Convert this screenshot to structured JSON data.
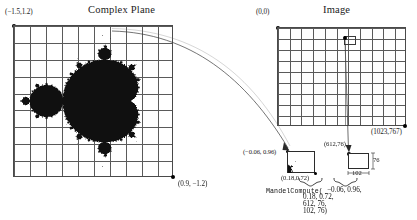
{
  "figure": {
    "panels": {
      "complex_plane": {
        "title": "Complex Plane",
        "corner_top_left": "(−1.5,1.2)",
        "corner_bottom_right": "(0.9, −1.2)",
        "grid_cols": 10,
        "grid_rows": 9,
        "content": "mandelbrot-set"
      },
      "image": {
        "title": "Image",
        "corner_top_left": "(0,0)",
        "corner_bottom_right": "(1023,767)",
        "grid_cols": 11,
        "grid_rows": 9
      }
    },
    "callouts": {
      "complex_region": {
        "top_left_label": "(−0.06, 0.96)",
        "bottom_right_label": "(0.18,0.72)"
      },
      "image_region": {
        "origin_label": "(612,76)",
        "height_label": "76",
        "width_label": "102"
      }
    },
    "call": {
      "function_name": "MandelCompute(",
      "line1_args": "−0.06, 0.96,",
      "line2_args": "0.18, 0.72,",
      "line3_args": "612, 76,",
      "line4_args": "102, 76)"
    }
  },
  "chart_data": {
    "type": "diagram",
    "panels": [
      {
        "name": "Complex Plane",
        "xlabel": "Re",
        "ylabel": "Im",
        "xlim": [
          -1.5,
          0.9
        ],
        "ylim": [
          -1.2,
          1.2
        ],
        "grid": true,
        "grid_cols": 10,
        "grid_rows": 9,
        "corner_labels": {
          "top_left": [
            -1.5,
            1.2
          ],
          "bottom_right": [
            0.9,
            -1.2
          ]
        },
        "rendered_set": "Mandelbrot set (black filled region)"
      },
      {
        "name": "Image",
        "xlabel": "pixel x",
        "ylabel": "pixel y",
        "xlim": [
          0,
          1023
        ],
        "ylim": [
          0,
          767
        ],
        "grid": true,
        "grid_cols": 11,
        "grid_rows": 9,
        "corner_labels": {
          "top_left": [
            0,
            0
          ],
          "bottom_right": [
            1023,
            767
          ]
        },
        "marked_point": [
          612,
          76
        ]
      }
    ],
    "mapping": {
      "complex_rect_top_left": [
        -0.06,
        0.96
      ],
      "complex_rect_bottom_right": [
        0.18,
        0.72
      ],
      "image_rect_origin": [
        612,
        76
      ],
      "image_rect_width": 102,
      "image_rect_height": 76,
      "call_signature": "MandelCompute(-0.06, 0.96, 0.18, 0.72, 612, 76, 102, 76)"
    }
  }
}
